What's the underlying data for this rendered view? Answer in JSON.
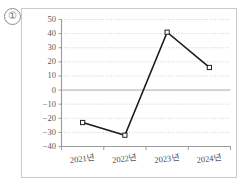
{
  "figure": {
    "index_label": "①"
  },
  "chart_data": {
    "type": "line",
    "title": "",
    "subtitle": "",
    "xlabel": "",
    "ylabel": "",
    "categories": [
      "2021년",
      "2022년",
      "2023년",
      "2024년"
    ],
    "values": [
      -23,
      -32,
      41,
      16
    ],
    "series": [
      {
        "name": "",
        "values": [
          -23,
          -32,
          41,
          16
        ]
      }
    ],
    "ylim": [
      -40,
      50
    ],
    "ytick_step": 10,
    "ytick_labels": [
      "50",
      "40",
      "30",
      "20",
      "10",
      "0",
      "−10",
      "−20",
      "−30",
      "−40"
    ],
    "ytick_values": [
      50,
      40,
      30,
      20,
      10,
      0,
      -10,
      -20,
      -30,
      -40
    ],
    "grid": true,
    "grid_style": "dotted",
    "zero_line": true,
    "legend": false,
    "legend_position": "none",
    "marker": "open-square",
    "line_color": "#1b1b1b",
    "marker_face_color": "#ffffff",
    "marker_edge_color": "#222222",
    "grid_color": "#b9b9c9",
    "axis_color": "#9b9b9b",
    "tick_label_color": "#5a5a5a",
    "annotations": []
  }
}
